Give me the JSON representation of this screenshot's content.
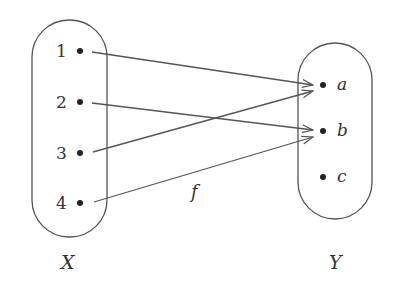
{
  "diagram": {
    "type": "function-mapping",
    "function_label": "f",
    "domain": {
      "label": "X",
      "elements": [
        "1",
        "2",
        "3",
        "4"
      ]
    },
    "codomain": {
      "label": "Y",
      "elements": [
        "a",
        "b",
        "c"
      ]
    },
    "mappings": [
      {
        "from": "1",
        "to": "a"
      },
      {
        "from": "2",
        "to": "b"
      },
      {
        "from": "3",
        "to": "a"
      },
      {
        "from": "4",
        "to": "b"
      }
    ],
    "colors": {
      "stroke": "#555555",
      "text": "#333333",
      "background": "#ffffff"
    }
  }
}
